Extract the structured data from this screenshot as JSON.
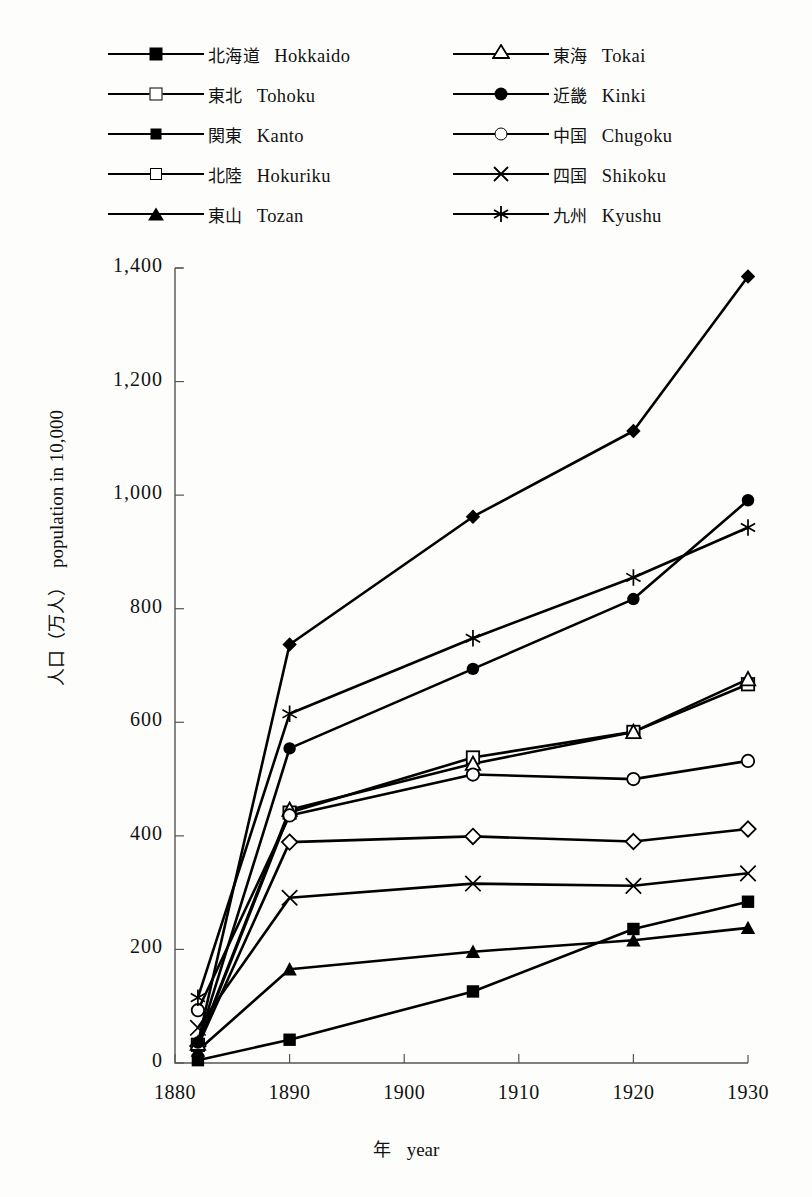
{
  "chart_data": {
    "type": "line",
    "title": "",
    "xlabel_jp": "年",
    "xlabel_en": "year",
    "ylabel_jp": "人口（万人）",
    "ylabel_en": "population in 10,000",
    "xlim": [
      1880,
      1930
    ],
    "ylim": [
      0,
      1400
    ],
    "x_ticks": [
      1880,
      1890,
      1900,
      1910,
      1920,
      1930
    ],
    "y_ticks": [
      "0",
      "200",
      "400",
      "600",
      "800",
      "1,000",
      "1,200",
      "1,400"
    ],
    "y_tick_values": [
      0,
      200,
      400,
      600,
      800,
      1000,
      1200,
      1400
    ],
    "grid": false,
    "legend_position": "top",
    "x": [
      1882,
      1890,
      1906,
      1920,
      1930
    ],
    "series": [
      {
        "name_jp": "北海道",
        "name_en": "Hokkaido",
        "marker": "square-filled",
        "values": [
          5,
          41,
          126,
          236,
          284
        ]
      },
      {
        "name_jp": "東北",
        "name_en": "Tohoku",
        "marker": "square-open",
        "values": [
          32,
          441,
          538,
          583,
          667
        ]
      },
      {
        "name_jp": "関東",
        "name_en": "Kanto",
        "marker": "diamond-filled",
        "values": [
          35,
          737,
          962,
          1113,
          1385
        ]
      },
      {
        "name_jp": "北陸",
        "name_en": "Hokuriku",
        "marker": "diamond-open",
        "values": [
          30,
          389,
          399,
          390,
          412
        ]
      },
      {
        "name_jp": "東山",
        "name_en": "Tozan",
        "marker": "triangle-filled",
        "values": [
          22,
          165,
          196,
          216,
          238
        ]
      },
      {
        "name_jp": "東海",
        "name_en": "Tokai",
        "marker": "triangle-open",
        "values": [
          34,
          446,
          527,
          583,
          676
        ]
      },
      {
        "name_jp": "近畿",
        "name_en": "Kinki",
        "marker": "circle-filled",
        "values": [
          36,
          554,
          694,
          817,
          991
        ]
      },
      {
        "name_jp": "中国",
        "name_en": "Chugoku",
        "marker": "circle-open",
        "values": [
          93,
          436,
          508,
          500,
          532
        ]
      },
      {
        "name_jp": "四国",
        "name_en": "Shikoku",
        "marker": "cross-x",
        "values": [
          62,
          291,
          316,
          312,
          334
        ]
      },
      {
        "name_jp": "九州",
        "name_en": "Kyushu",
        "marker": "asterisk",
        "values": [
          115,
          615,
          748,
          855,
          943
        ]
      }
    ]
  },
  "legend": {
    "left_column": [
      {
        "jp": "北海道",
        "en": "Hokkaido",
        "marker": "square-filled"
      },
      {
        "jp": "東北",
        "en": "Tohoku",
        "marker": "square-open"
      },
      {
        "jp": "関東",
        "en": "Kanto",
        "marker": "diamond-filled"
      },
      {
        "jp": "北陸",
        "en": "Hokuriku",
        "marker": "diamond-open"
      },
      {
        "jp": "東山",
        "en": "Tozan",
        "marker": "triangle-filled"
      }
    ],
    "right_column": [
      {
        "jp": "東海",
        "en": "Tokai",
        "marker": "triangle-open"
      },
      {
        "jp": "近畿",
        "en": "Kinki",
        "marker": "circle-filled"
      },
      {
        "jp": "中国",
        "en": "Chugoku",
        "marker": "circle-open"
      },
      {
        "jp": "四国",
        "en": "Shikoku",
        "marker": "cross-x"
      },
      {
        "jp": "九州",
        "en": "Kyushu",
        "marker": "asterisk"
      }
    ]
  },
  "colors": {
    "ink": "#000000",
    "axis": "#444444",
    "background": "#fdfdfb"
  }
}
